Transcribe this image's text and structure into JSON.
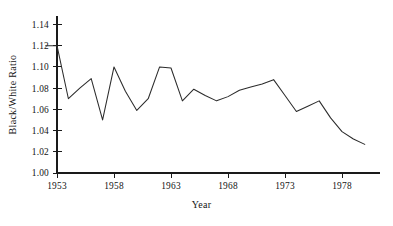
{
  "chart_data": {
    "type": "line",
    "title": "",
    "xlabel": "Year",
    "ylabel": "Black/White Ratio",
    "xlim": [
      1952,
      1980
    ],
    "ylim": [
      1.0,
      1.148
    ],
    "grid": false,
    "legend": null,
    "ytick_labels": [
      "1.00",
      "1.02",
      "1.04",
      "1.06",
      "1.08",
      "1.10",
      "1.12",
      "1.14"
    ],
    "ytick_values": [
      1.0,
      1.02,
      1.04,
      1.06,
      1.08,
      1.1,
      1.12,
      1.14
    ],
    "xtick_labels": [
      "1953",
      "1958",
      "1963",
      "1968",
      "1973",
      "1978"
    ],
    "xtick_values": [
      1953,
      1958,
      1963,
      1968,
      1973,
      1978
    ],
    "x": [
      1952,
      1953,
      1954,
      1955,
      1956,
      1957,
      1958,
      1959,
      1960,
      1961,
      1962,
      1963,
      1964,
      1965,
      1966,
      1967,
      1968,
      1969,
      1970,
      1971,
      1972,
      1973,
      1974,
      1975,
      1976,
      1977,
      1978,
      1979,
      1980
    ],
    "series": [
      {
        "name": "Black/White Ratio",
        "values": [
          1.12,
          1.12,
          1.07,
          1.08,
          1.089,
          1.05,
          1.1,
          1.077,
          1.059,
          1.07,
          1.1,
          1.099,
          1.068,
          1.079,
          1.073,
          1.068,
          1.072,
          1.078,
          1.081,
          1.084,
          1.088,
          1.073,
          1.058,
          1.063,
          1.068,
          1.052,
          1.039,
          1.032,
          1.027
        ]
      }
    ]
  },
  "axes": {
    "y_title": "Black/White Ratio",
    "x_title": "Year"
  }
}
